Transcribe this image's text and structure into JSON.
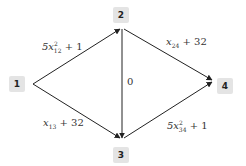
{
  "diagram": {
    "type": "directed-graph",
    "nodes": [
      {
        "id": "1",
        "label": "1"
      },
      {
        "id": "2",
        "label": "2"
      },
      {
        "id": "3",
        "label": "3"
      },
      {
        "id": "4",
        "label": "4"
      }
    ],
    "edges": [
      {
        "from": "1",
        "to": "2",
        "label": "5x_12^2 + 1",
        "coef": "5x",
        "sub": "12",
        "sup": "2",
        "tail": " + 1"
      },
      {
        "from": "1",
        "to": "3",
        "label": "x_13 + 32",
        "coef": "x",
        "sub": "13",
        "tail": " + 32"
      },
      {
        "from": "2",
        "to": "3",
        "label": "0"
      },
      {
        "from": "2",
        "to": "4",
        "label": "x_24 + 32",
        "coef": "x",
        "sub": "24",
        "tail": " + 32"
      },
      {
        "from": "3",
        "to": "4",
        "label": "5x_34^2 + 1",
        "coef": "5x",
        "sub": "34",
        "sup": "2",
        "tail": " + 1"
      }
    ],
    "colors": {
      "node_bg": "#e4e4e4",
      "edge": "#222222",
      "text": "#333333"
    }
  }
}
